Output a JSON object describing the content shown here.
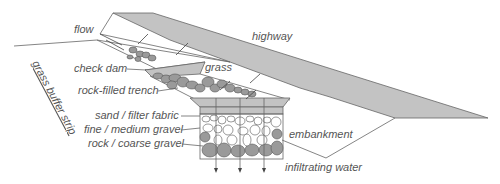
{
  "diagram": {
    "type": "infiltration trench cross-section",
    "labels": {
      "flow": "flow",
      "highway": "highway",
      "check_dam": "check dam",
      "grass": "grass",
      "rock_filled_trench": "rock-filled trench",
      "grass_buffer_strip": "grass buffer strip",
      "sand_filter_fabric": "sand / filter fabric",
      "fine_medium_gravel": "fine / medium gravel",
      "rock_coarse_gravel": "rock / coarse gravel",
      "embankment": "embankment",
      "infiltrating_water": "infiltrating water"
    },
    "colors": {
      "fill_gray": "#c3c3c3",
      "rock_gray": "#9a9a9a",
      "line": "#666666",
      "text": "#555555"
    }
  }
}
